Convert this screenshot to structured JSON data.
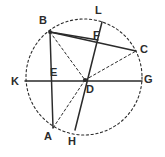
{
  "figure": {
    "background_color": "#ffffff",
    "stroke_color": "#2b2b2b",
    "label_color": "#2b2b2b",
    "circle": {
      "name": "circle-outline",
      "center_x": 84,
      "center_y": 77,
      "radius": 58,
      "style": "dashed"
    },
    "points": [
      {
        "id": "A",
        "label": "A",
        "x": 53,
        "y": 128,
        "label_x": 44,
        "label_y": 131
      },
      {
        "id": "B",
        "label": "B",
        "x": 50,
        "y": 32,
        "label_x": 39,
        "label_y": 15
      },
      {
        "id": "C",
        "label": "C",
        "x": 136,
        "y": 51,
        "label_x": 140,
        "label_y": 44
      },
      {
        "id": "D",
        "label": "D",
        "x": 85,
        "y": 80,
        "label_x": 86,
        "label_y": 84
      },
      {
        "id": "E",
        "label": "E",
        "x": 52,
        "y": 81,
        "label_x": 50,
        "label_y": 67
      },
      {
        "id": "F",
        "label": "F",
        "x": 98,
        "y": 40,
        "label_x": 93,
        "label_y": 30
      },
      {
        "id": "G",
        "label": "G",
        "x": 142,
        "y": 81,
        "label_x": 144,
        "label_y": 74
      },
      {
        "id": "H",
        "label": "H",
        "x": 75,
        "y": 130,
        "label_x": 68,
        "label_y": 136
      },
      {
        "id": "K",
        "label": "K",
        "x": 25,
        "y": 81,
        "label_x": 11,
        "label_y": 76
      },
      {
        "id": "L",
        "label": "L",
        "x": 102,
        "y": 22,
        "label_x": 95,
        "label_y": 5
      }
    ],
    "segments": [
      {
        "name": "segment-B-C",
        "from": "B",
        "to": "C",
        "style": "solid"
      },
      {
        "name": "segment-B-A",
        "from": "B",
        "to": "A",
        "style": "solid"
      },
      {
        "name": "segment-K-G",
        "from": "K",
        "to": "G",
        "style": "solid"
      },
      {
        "name": "segment-L-H",
        "from": "L",
        "to": "H",
        "style": "solid"
      },
      {
        "name": "segment-B-D",
        "from": "B",
        "to": "D",
        "style": "dashed"
      },
      {
        "name": "segment-D-C",
        "from": "D",
        "to": "C",
        "style": "dashed"
      },
      {
        "name": "segment-D-A",
        "from": "D",
        "to": "A",
        "style": "dashed"
      },
      {
        "name": "segment-B-F",
        "from": "B",
        "to": "F",
        "style": "solid"
      }
    ]
  }
}
